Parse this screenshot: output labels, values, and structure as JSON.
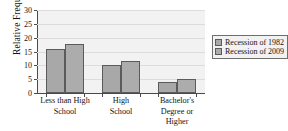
{
  "chart_data": {
    "type": "bar",
    "title": "",
    "xlabel": "",
    "ylabel": "Relative Frequency",
    "ylim": [
      0,
      30
    ],
    "yticks": [
      0,
      5,
      10,
      15,
      20,
      25,
      30
    ],
    "ytick_labels": [
      "0",
      "5",
      "10",
      "15",
      "20",
      "25",
      "30"
    ],
    "grid": true,
    "legend_position": "right",
    "categories": [
      "Less than High School",
      "High School",
      "Bachelor's Degree or Higher"
    ],
    "category_lines": [
      [
        "Less than High",
        "School"
      ],
      [
        "High",
        "School"
      ],
      [
        "Bachelor's",
        "Degree or",
        "Higher"
      ]
    ],
    "series": [
      {
        "name": "Recession of 1982",
        "color": "#a8a8a8",
        "values": [
          15.8,
          10.0,
          3.9
        ]
      },
      {
        "name": "Recession of 2009",
        "color": "#acacac",
        "values": [
          17.6,
          11.7,
          5.0
        ]
      }
    ]
  },
  "legend": {
    "items": [
      {
        "label": "Recession of 1982"
      },
      {
        "label": "Recession of 2009"
      }
    ]
  },
  "colors": {
    "plot_background": "#f2f2f2",
    "gridline": "#dcdcdc",
    "axis": "#4a4a4a",
    "bar_outline": "#5b5b5b",
    "series_1": "#a8a8a8",
    "series_2": "#acacac"
  }
}
